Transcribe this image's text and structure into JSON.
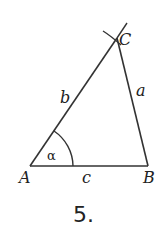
{
  "figure": {
    "number": "5.",
    "vertices": {
      "A": "A",
      "B": "B",
      "C": "C"
    },
    "sides": {
      "a": "a",
      "b": "b",
      "c": "c"
    },
    "angle": "α"
  }
}
